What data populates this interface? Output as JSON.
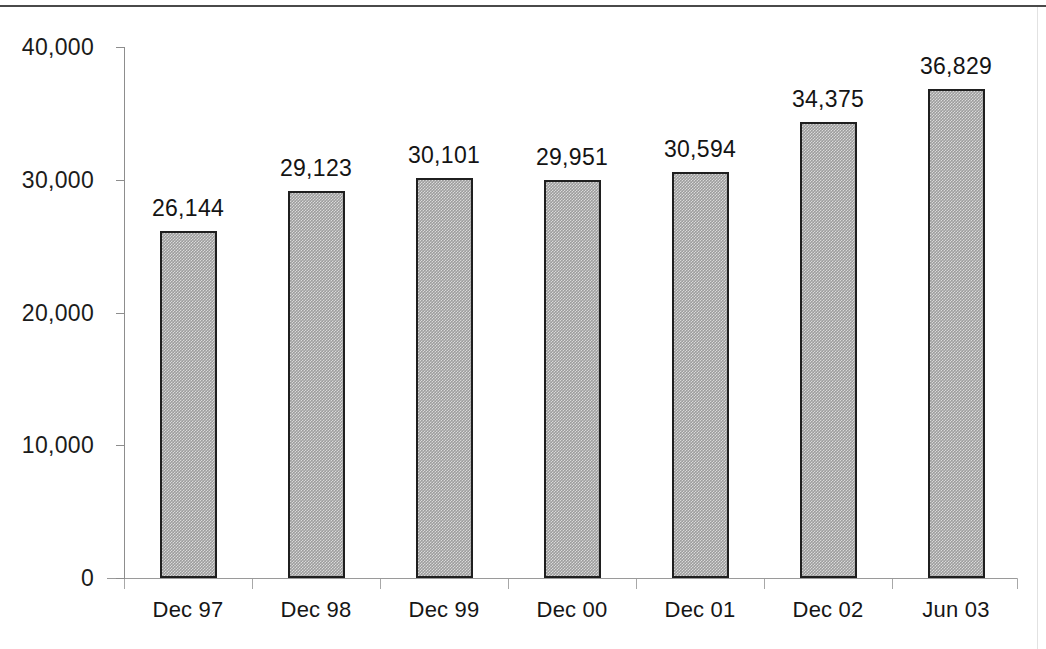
{
  "chart_data": {
    "type": "bar",
    "title": "",
    "subtitle": "",
    "xlabel": "",
    "ylabel": "",
    "categories": [
      "Dec 97",
      "Dec 98",
      "Dec 99",
      "Dec 00",
      "Dec 01",
      "Dec 02",
      "Jun 03"
    ],
    "values": [
      26144,
      29123,
      30101,
      29951,
      30594,
      34375,
      36829
    ],
    "value_labels": [
      "26,144",
      "29,123",
      "30,101",
      "29,951",
      "30,594",
      "34,375",
      "36,829"
    ],
    "ylim": [
      0,
      40000
    ],
    "ytick_values": [
      0,
      10000,
      20000,
      30000,
      40000
    ],
    "ytick_labels": [
      "0",
      "10,000",
      "20,000",
      "30,000",
      "40,000"
    ],
    "grid": false,
    "legend": null,
    "legend_position": "none",
    "series": [
      {
        "name": "",
        "values": [
          26144,
          29123,
          30101,
          29951,
          30594,
          34375,
          36829
        ]
      }
    ],
    "colors": {
      "bar_fill": "#9d9d9d",
      "bar_border": "#1f1f1f",
      "axis": "#8d8d8d",
      "text": "#141414",
      "background": "#ffffff"
    }
  }
}
